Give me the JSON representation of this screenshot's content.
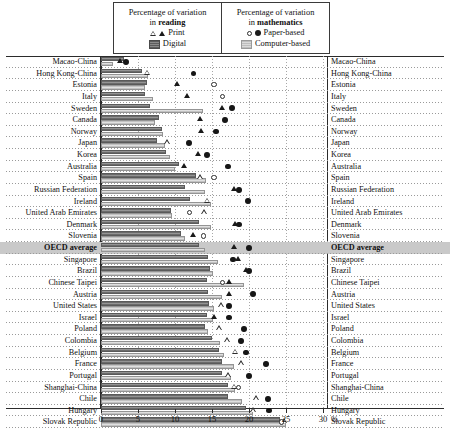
{
  "legend": {
    "reading": {
      "title_line1": "Percentage of variation",
      "title_line2_pre": "in ",
      "title_line2_bold": "reading",
      "items": [
        {
          "label": "Print",
          "symbols": [
            "triangle-open",
            "triangle-filled"
          ]
        },
        {
          "label": "Digital",
          "symbols": [
            "bar-dark"
          ]
        }
      ]
    },
    "mathematics": {
      "title_line1": "Percentage of variation",
      "title_line2_pre": "in ",
      "title_line2_bold": "mathematics",
      "items": [
        {
          "label": "Paper-based",
          "symbols": [
            "circle-open",
            "circle-filled"
          ]
        },
        {
          "label": "Computer-based",
          "symbols": [
            "bar-light"
          ]
        }
      ]
    }
  },
  "chart_data": {
    "type": "bar",
    "title": "",
    "xlabel": "",
    "ylabel": "",
    "xlim": [
      0,
      31
    ],
    "axis_unit": "%",
    "ticks": [
      0,
      5,
      10,
      15,
      20,
      25,
      30
    ],
    "tick_labels": [
      "0",
      "5",
      "10",
      "15",
      "20",
      "25",
      "30"
    ],
    "grid": true,
    "legend_position": "top",
    "highlight_row": "OECD average",
    "series": [
      {
        "name": "Digital (reading)",
        "type": "bar",
        "style": "dark-hatched"
      },
      {
        "name": "Computer-based (mathematics)",
        "type": "bar",
        "style": "light-hatched"
      },
      {
        "name": "Print (reading)",
        "type": "marker",
        "style": "triangle"
      },
      {
        "name": "Paper-based (mathematics)",
        "type": "marker",
        "style": "circle"
      }
    ],
    "categories": [
      "Macao-China",
      "Hong Kong-China",
      "Estonia",
      "Italy",
      "Sweden",
      "Canada",
      "Norway",
      "Japan",
      "Korea",
      "Australia",
      "Spain",
      "Russian Federation",
      "Ireland",
      "United Arab Emirates",
      "Denmark",
      "Slovenia",
      "OECD average",
      "Singapore",
      "Brazil",
      "Chinese Taipei",
      "Austria",
      "United States",
      "Israel",
      "Poland",
      "Colombia",
      "Belgium",
      "France",
      "Portugal",
      "Shanghai-China",
      "Chile",
      "Hungary",
      "Slovak Republic"
    ],
    "rows": [
      {
        "country": "Macao-China",
        "digital": 3.1,
        "computer": 1.6,
        "print": 2.6,
        "print_filled": true,
        "paper": 3.4,
        "paper_filled": true
      },
      {
        "country": "Hong Kong-China",
        "digital": 5.5,
        "computer": 6.4,
        "print": 6.2,
        "print_filled": false,
        "paper": 12.5,
        "paper_filled": true
      },
      {
        "country": "Estonia",
        "digital": 6.2,
        "computer": 6.0,
        "print": 10.3,
        "print_filled": true,
        "paper": 15.3,
        "paper_filled": false
      },
      {
        "country": "Italy",
        "digital": 6.0,
        "computer": 7.0,
        "print": 11.7,
        "print_filled": true,
        "paper": 16.4,
        "paper_filled": false
      },
      {
        "country": "Sweden",
        "digital": 6.6,
        "computer": 13.8,
        "print": 16.4,
        "print_filled": true,
        "paper": 17.7,
        "paper_filled": true
      },
      {
        "country": "Canada",
        "digital": 7.8,
        "computer": 7.3,
        "print": 13.4,
        "print_filled": true,
        "paper": 16.8,
        "paper_filled": true
      },
      {
        "country": "Norway",
        "digital": 8.3,
        "computer": 8.4,
        "print": 13.5,
        "print_filled": true,
        "paper": 15.5,
        "paper_filled": true
      },
      {
        "country": "Japan",
        "digital": 7.6,
        "computer": 8.6,
        "print": 9.0,
        "print_filled": false,
        "paper": 11.9,
        "paper_filled": true
      },
      {
        "country": "Korea",
        "digital": 8.8,
        "computer": 9.3,
        "print": 13.1,
        "print_filled": true,
        "paper": 14.3,
        "paper_filled": true
      },
      {
        "country": "Australia",
        "digital": 10.5,
        "computer": 10.0,
        "print": 11.2,
        "print_filled": true,
        "paper": 17.2,
        "paper_filled": true
      },
      {
        "country": "Spain",
        "digital": 12.9,
        "computer": 14.2,
        "print": 13.4,
        "print_filled": false,
        "paper": 15.3,
        "paper_filled": false
      },
      {
        "country": "Russian Federation",
        "digital": 11.4,
        "computer": 14.0,
        "print": 18.0,
        "print_filled": true,
        "paper": 18.6,
        "paper_filled": true
      },
      {
        "country": "Ireland",
        "digital": 12.0,
        "computer": 14.9,
        "print": 14.4,
        "print_filled": false,
        "paper": 19.9,
        "paper_filled": true
      },
      {
        "country": "United Arab Emirates",
        "digital": 9.4,
        "computer": 9.6,
        "print": 14.0,
        "print_filled": false,
        "paper": 12.0,
        "paper_filled": false
      },
      {
        "country": "Denmark",
        "digital": 13.2,
        "computer": 14.8,
        "print": 18.1,
        "print_filled": true,
        "paper": 18.6,
        "paper_filled": true
      },
      {
        "country": "Slovenia",
        "digital": 10.8,
        "computer": 11.3,
        "print": 12.5,
        "print_filled": true,
        "paper": 13.9,
        "paper_filled": false
      },
      {
        "country": "OECD average",
        "digital": 13.2,
        "computer": 14.1,
        "print": 18.0,
        "print_filled": true,
        "paper": 20.0,
        "paper_filled": true
      },
      {
        "country": "Singapore",
        "digital": 14.5,
        "computer": 15.8,
        "print": 18.6,
        "print_filled": true,
        "paper": 17.8,
        "paper_filled": true
      },
      {
        "country": "Brazil",
        "digital": 14.7,
        "computer": 15.1,
        "print": 19.6,
        "print_filled": true,
        "paper": 20.0,
        "paper_filled": true
      },
      {
        "country": "Chinese Taipei",
        "digital": 14.3,
        "computer": 19.3,
        "print": 17.3,
        "print_filled": true,
        "paper": 16.4,
        "paper_filled": false
      },
      {
        "country": "Austria",
        "digital": 14.5,
        "computer": 16.3,
        "print": 17.3,
        "print_filled": true,
        "paper": 20.5,
        "paper_filled": true
      },
      {
        "country": "United States",
        "digital": 14.6,
        "computer": 15.3,
        "print": 16.2,
        "print_filled": false,
        "paper": 17.3,
        "paper_filled": true
      },
      {
        "country": "Israel",
        "digital": 14.3,
        "computer": 15.1,
        "print": 15.3,
        "print_filled": true,
        "paper": 17.3,
        "paper_filled": true
      },
      {
        "country": "Poland",
        "digital": 14.0,
        "computer": 14.4,
        "print": 16.0,
        "print_filled": false,
        "paper": 19.3,
        "paper_filled": true
      },
      {
        "country": "Colombia",
        "digital": 15.0,
        "computer": 16.1,
        "print": 17.1,
        "print_filled": false,
        "paper": 18.9,
        "paper_filled": true
      },
      {
        "country": "Belgium",
        "digital": 16.0,
        "computer": 16.6,
        "print": 18.2,
        "print_filled": false,
        "paper": 19.6,
        "paper_filled": true
      },
      {
        "country": "France",
        "digital": 16.4,
        "computer": 18.0,
        "print": 19.0,
        "print_filled": false,
        "paper": 22.3,
        "paper_filled": true
      },
      {
        "country": "Portugal",
        "digital": 16.3,
        "computer": 17.5,
        "print": 17.2,
        "print_filled": false,
        "paper": 20.0,
        "paper_filled": true
      },
      {
        "country": "Shanghai-China",
        "digital": 17.1,
        "computer": 18.1,
        "print": 18.0,
        "print_filled": false,
        "paper": 18.6,
        "paper_filled": false
      },
      {
        "country": "Chile",
        "digital": 17.2,
        "computer": 19.0,
        "print": 21.0,
        "print_filled": false,
        "paper": 22.6,
        "paper_filled": true
      },
      {
        "country": "Hungary",
        "digital": 19.6,
        "computer": 20.6,
        "print": 20.6,
        "print_filled": false,
        "paper": 22.7,
        "paper_filled": true
      },
      {
        "country": "Slovak Republic",
        "digital": 24.2,
        "computer": 25.0,
        "print": 24.8,
        "print_filled": false,
        "paper": 24.4,
        "paper_filled": false
      }
    ]
  }
}
